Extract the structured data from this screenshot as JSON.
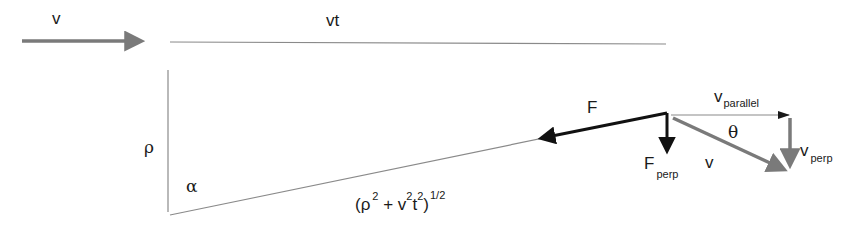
{
  "diagram": {
    "colors": {
      "background": "#ffffff",
      "thin_line": "#8a8a8a",
      "gray_vector": "#7a7a7a",
      "black_vector": "#111111",
      "text": "#1a1a1a"
    },
    "labels": {
      "v_top": "v",
      "vt": "vt",
      "rho": "ρ",
      "alpha": "α",
      "distance": {
        "open": "(ρ",
        "exp1": "2",
        "plus": " + v",
        "exp2": "2",
        "t": "t",
        "exp3": "2",
        "close": ")",
        "exp_half": "1/2"
      },
      "F": "F",
      "F_perp_main": "F",
      "F_perp_sub": "perp",
      "v_parallel_main": "v",
      "v_parallel_sub": "parallel",
      "theta": "θ",
      "v_diag": "v",
      "v_perp_main": "v",
      "v_perp_sub": "perp"
    },
    "elements": [
      {
        "name": "velocity-arrow",
        "from": [
          22,
          41
        ],
        "to": [
          146,
          41
        ],
        "style": "gray-thick"
      },
      {
        "name": "vt-line",
        "from": [
          170,
          42
        ],
        "to": [
          666,
          44
        ],
        "style": "thin"
      },
      {
        "name": "rho-line",
        "from": [
          168,
          70
        ],
        "to": [
          168,
          212
        ],
        "style": "thin"
      },
      {
        "name": "hypotenuse-line",
        "from": [
          170,
          215
        ],
        "to": [
          665,
          113
        ],
        "style": "thin"
      },
      {
        "name": "force-arrow",
        "from": [
          667,
          113
        ],
        "to": [
          533,
          140
        ],
        "style": "black-thick"
      },
      {
        "name": "force-perp-arrow",
        "from": [
          667,
          113
        ],
        "to": [
          667,
          158
        ],
        "style": "black-thick"
      },
      {
        "name": "v-parallel-arrow",
        "from": [
          670,
          115
        ],
        "to": [
          789,
          115
        ],
        "style": "thin-arrow"
      },
      {
        "name": "v-diagonal-arrow",
        "from": [
          673,
          118
        ],
        "to": [
          789,
          172
        ],
        "style": "gray-thick"
      },
      {
        "name": "v-perp-arrow",
        "from": [
          790,
          118
        ],
        "to": [
          790,
          172
        ],
        "style": "gray-thick"
      }
    ]
  }
}
